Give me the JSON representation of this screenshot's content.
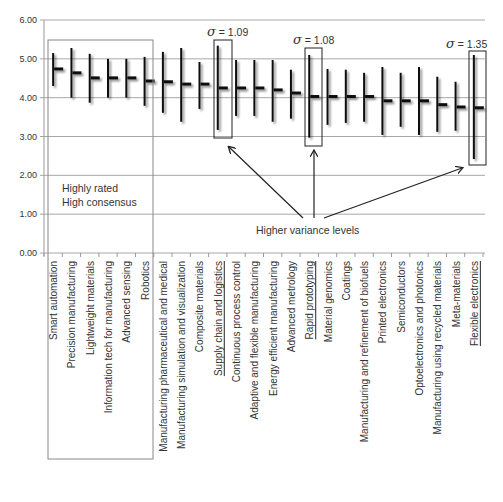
{
  "chart_data": {
    "type": "error-bar",
    "title": "",
    "xlabel": "",
    "ylabel": "",
    "ylim": [
      0,
      6
    ],
    "yticks": [
      "0.00",
      "1.00",
      "2.00",
      "3.00",
      "4.00",
      "5.00",
      "6.00"
    ],
    "grid": true,
    "categories": [
      "Smart automation",
      "Precision manufacturing",
      "Lightweight materials",
      "Information tech for manufacturing",
      "Advanced sensing",
      "Robotics",
      "Manufacturing pharmaceutical and medical",
      "Manufacturing simulation and visualization",
      "Composite materials",
      "Supply chain and logistics",
      "Continuous process control",
      "Adaptive and flexible manufacturing",
      "Energy efficient manufacturing",
      "Advanced metrology",
      "Rapid prototyping",
      "Material genomics",
      "Coatings",
      "Manufacturing and refinement of biofuels",
      "Printed electronics",
      "Semiconductors",
      "Optoelectronics and photonics",
      "Manufacturing using recycled materials",
      "Meta-materials",
      "Flexible electronics"
    ],
    "series": [
      {
        "name": "mean",
        "values": [
          4.74,
          4.64,
          4.51,
          4.51,
          4.51,
          4.43,
          4.41,
          4.35,
          4.35,
          4.25,
          4.25,
          4.25,
          4.2,
          4.12,
          4.03,
          4.03,
          4.03,
          4.03,
          3.92,
          3.92,
          3.92,
          3.82,
          3.76,
          3.74
        ]
      },
      {
        "name": "upper",
        "values": [
          5.15,
          5.28,
          5.13,
          5.0,
          5.0,
          5.05,
          5.18,
          5.28,
          4.92,
          5.34,
          4.97,
          4.97,
          4.97,
          4.72,
          5.1,
          4.74,
          4.72,
          4.64,
          4.79,
          4.64,
          4.79,
          4.54,
          4.41,
          5.1
        ]
      },
      {
        "name": "lower",
        "values": [
          4.3,
          4.0,
          3.87,
          4.0,
          4.0,
          3.79,
          3.61,
          3.38,
          3.71,
          3.17,
          3.53,
          3.53,
          3.38,
          3.46,
          2.97,
          3.3,
          3.35,
          3.38,
          3.04,
          3.25,
          3.04,
          3.12,
          3.15,
          2.42
        ]
      }
    ],
    "underlined_categories": [
      9,
      14,
      23
    ],
    "annotations": {
      "highlight_group": {
        "label_line1": "Highly rated",
        "label_line2": "High consensus",
        "categories": [
          0,
          1,
          2,
          3,
          4,
          5
        ]
      },
      "variance_note": "Higher variance levels",
      "sigma_labels": [
        {
          "category": 9,
          "symbol": "σ",
          "text": " = 1.09"
        },
        {
          "category": 14,
          "symbol": "σ",
          "text": " = 1.08"
        },
        {
          "category": 23,
          "symbol": "σ",
          "text": " = 1.35"
        }
      ]
    }
  }
}
